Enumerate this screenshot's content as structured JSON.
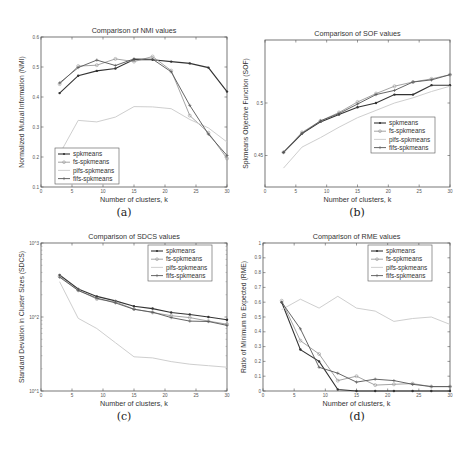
{
  "chart_data": [
    {
      "id": "a",
      "type": "line",
      "title": "Comparison of NMI values",
      "xlabel": "Number of clusters, k",
      "ylabel": "Normalized Mutual Information (NMI)",
      "caption": "(a)",
      "xlim": [
        0,
        30
      ],
      "ylim": [
        0.1,
        0.6
      ],
      "yscale": "linear",
      "xticks": [
        0,
        5,
        10,
        15,
        20,
        25,
        30
      ],
      "yticks": [
        0.1,
        0.2,
        0.3,
        0.4,
        0.5,
        0.6
      ],
      "ytick_labels": [
        "0.1",
        "0.2",
        "0.3",
        "0.4",
        "0.5",
        "0.6"
      ],
      "legend_position": "lower left",
      "grid": false,
      "x": [
        3,
        6,
        9,
        12,
        15,
        18,
        21,
        24,
        27,
        30
      ],
      "series": [
        {
          "name": "spkmeans",
          "values": [
            0.413,
            0.471,
            0.487,
            0.495,
            0.525,
            0.524,
            0.518,
            0.512,
            0.498,
            0.418
          ]
        },
        {
          "name": "fs-spkmeans",
          "values": [
            0.443,
            0.503,
            0.506,
            0.527,
            0.518,
            0.535,
            0.488,
            0.338,
            0.281,
            0.195
          ]
        },
        {
          "name": "pifs-spkmeans",
          "values": [
            0.21,
            0.322,
            0.317,
            0.333,
            0.368,
            0.367,
            0.361,
            0.325,
            0.297,
            0.25
          ]
        },
        {
          "name": "fifs-spkmeans",
          "values": [
            0.447,
            0.498,
            0.523,
            0.505,
            0.527,
            0.526,
            0.484,
            0.372,
            0.276,
            0.205
          ]
        }
      ]
    },
    {
      "id": "b",
      "type": "line",
      "title": "Comparison of SOF values",
      "xlabel": "Number of clusters, k",
      "ylabel": "Spkmeans Objective Function (SOF)",
      "caption": "(b)",
      "xlim": [
        0,
        30
      ],
      "ylim": [
        0.42,
        0.56
      ],
      "yscale": "linear",
      "xticks": [
        0,
        5,
        10,
        15,
        20,
        25,
        30
      ],
      "yticks": [
        0.45,
        0.5
      ],
      "ytick_labels": [
        "0.45",
        "0.5"
      ],
      "legend_position": "center right",
      "grid": false,
      "x": [
        3,
        6,
        9,
        12,
        15,
        18,
        21,
        24,
        27,
        30
      ],
      "series": [
        {
          "name": "spkmeans",
          "values": [
            0.453,
            0.471,
            0.482,
            0.489,
            0.496,
            0.5,
            0.508,
            0.508,
            0.517,
            0.517
          ]
        },
        {
          "name": "fs-spkmeans",
          "values": [
            0.453,
            0.472,
            0.483,
            0.491,
            0.501,
            0.509,
            0.516,
            0.52,
            0.523,
            0.527
          ]
        },
        {
          "name": "pifs-spkmeans",
          "values": [
            0.438,
            0.458,
            0.467,
            0.477,
            0.486,
            0.493,
            0.5,
            0.505,
            0.511,
            0.516
          ]
        },
        {
          "name": "fifs-spkmeans",
          "values": [
            0.453,
            0.471,
            0.483,
            0.49,
            0.499,
            0.508,
            0.512,
            0.52,
            0.522,
            0.527
          ]
        }
      ]
    },
    {
      "id": "c",
      "type": "line",
      "title": "Comparison of SDCS values",
      "xlabel": "Number of clusters, k",
      "ylabel": "Standard Deviation in Cluster Sizes (SDCS)",
      "caption": "(c)",
      "xlim": [
        0,
        30
      ],
      "ylim": [
        10,
        1000
      ],
      "yscale": "log",
      "xticks": [
        0,
        5,
        10,
        15,
        20,
        25,
        30
      ],
      "yticks": [
        10,
        100,
        1000
      ],
      "ytick_labels": [
        "10^1",
        "10^2",
        "10^3"
      ],
      "legend_position": "upper right",
      "grid": false,
      "x": [
        3,
        6,
        9,
        12,
        15,
        18,
        21,
        24,
        27,
        30
      ],
      "series": [
        {
          "name": "spkmeans",
          "values": [
            370,
            240,
            190,
            165,
            140,
            130,
            115,
            108,
            100,
            92
          ]
        },
        {
          "name": "fs-spkmeans",
          "values": [
            355,
            230,
            175,
            160,
            128,
            115,
            104,
            98,
            88,
            80
          ]
        },
        {
          "name": "pifs-spkmeans",
          "values": [
            300,
            96,
            70,
            45,
            29,
            28,
            25,
            23,
            22,
            21
          ]
        },
        {
          "name": "fifs-spkmeans",
          "values": [
            345,
            228,
            180,
            155,
            127,
            116,
            98,
            88,
            87,
            77
          ]
        }
      ]
    },
    {
      "id": "d",
      "type": "line",
      "title": "Comparison of RME values",
      "xlabel": "Number of clusters, k",
      "ylabel": "Ratio of Minimum to Expected (RME)",
      "caption": "(d)",
      "xlim": [
        0,
        30
      ],
      "ylim": [
        0,
        1
      ],
      "yscale": "linear",
      "xticks": [
        0,
        5,
        10,
        15,
        20,
        25,
        30
      ],
      "yticks": [
        0,
        0.1,
        0.2,
        0.3,
        0.4,
        0.5,
        0.6,
        0.7,
        0.8,
        0.9,
        1
      ],
      "ytick_labels": [
        "0",
        "0.1",
        "0.2",
        "0.3",
        "0.4",
        "0.5",
        "0.6",
        "0.7",
        "0.8",
        "0.9",
        "1"
      ],
      "legend_position": "upper right",
      "grid": false,
      "x": [
        3,
        6,
        9,
        12,
        15,
        18,
        21,
        24,
        27,
        30
      ],
      "series": [
        {
          "name": "spkmeans",
          "values": [
            0.6,
            0.28,
            0.2,
            0.01,
            0.0,
            0.0,
            0.0,
            0.0,
            0.0,
            0.0
          ]
        },
        {
          "name": "fs-spkmeans",
          "values": [
            0.61,
            0.34,
            0.25,
            0.07,
            0.1,
            0.04,
            0.045,
            0.05,
            0.03,
            0.03
          ]
        },
        {
          "name": "pifs-spkmeans",
          "values": [
            0.55,
            0.62,
            0.56,
            0.64,
            0.56,
            0.54,
            0.47,
            0.49,
            0.5,
            0.45
          ]
        },
        {
          "name": "fifs-spkmeans",
          "values": [
            0.6,
            0.42,
            0.16,
            0.12,
            0.06,
            0.08,
            0.07,
            0.045,
            0.03,
            0.03
          ]
        }
      ]
    }
  ],
  "legend_labels": [
    "spkmeans",
    "fs-spkmeans",
    "pifs-spkmeans",
    "fifs-spkmeans"
  ],
  "series_styles": [
    {
      "color": "#333333",
      "marker": "dot",
      "width": 1.1
    },
    {
      "color": "#9a9a9a",
      "marker": "circle",
      "width": 0.9
    },
    {
      "color": "#c8c8c8",
      "marker": "none",
      "width": 0.9
    },
    {
      "color": "#555555",
      "marker": "plus",
      "width": 0.9
    }
  ]
}
